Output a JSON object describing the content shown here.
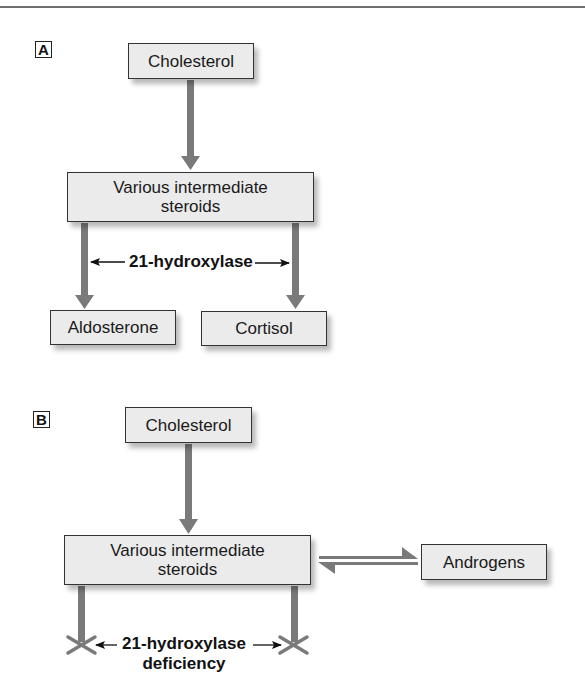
{
  "panel_a": {
    "label": "A",
    "source": "Cholesterol",
    "intermediate_line1": "Various intermediate",
    "intermediate_line2": "steroids",
    "enzyme": "21-hydroxylase",
    "product_left": "Aldosterone",
    "product_right": "Cortisol"
  },
  "panel_b": {
    "label": "B",
    "source": "Cholesterol",
    "intermediate_line1": "Various intermediate",
    "intermediate_line2": "steroids",
    "side_product": "Androgens",
    "enzyme_line1": "21-hydroxylase",
    "enzyme_line2": "deficiency"
  },
  "colors": {
    "arrow": "#7a7a7a",
    "box_fill": "#ebebeb",
    "box_border": "#333333"
  }
}
